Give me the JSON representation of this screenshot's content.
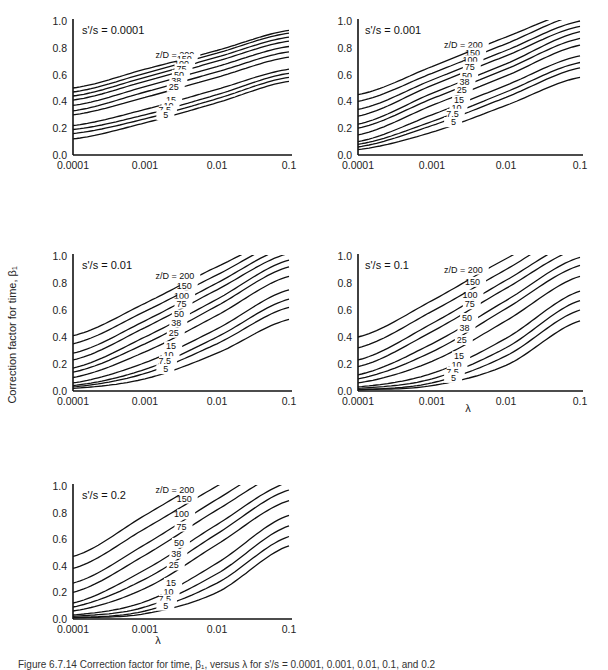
{
  "figure": {
    "y_axis_label": "Correction factor for time, β₁",
    "x_axis_label": "λ",
    "caption": "Figure 6.7.14 Correction factor for time, β₁, versus λ for s'/s = 0.0001, 0.001, 0.01, 0.1, and 0.2"
  },
  "chart_data": [
    {
      "type": "line",
      "title": "s'/s = 0.0001",
      "xlabel": "",
      "ylabel": "",
      "x_scale": "log",
      "xlim": [
        0.0001,
        0.1
      ],
      "ylim": [
        0,
        1.0
      ],
      "xticks": [
        "0.0001",
        "0.001",
        "0.01",
        "0.1"
      ],
      "yticks": [
        "0.0",
        "0.2",
        "0.4",
        "0.6",
        "0.8",
        "1.0"
      ],
      "label_prefix": "z/D = ",
      "x": [
        0.0001,
        0.001,
        0.01,
        0.1
      ],
      "series": [
        {
          "name": "200",
          "values": [
            0.5,
            0.64,
            0.78,
            0.93
          ]
        },
        {
          "name": "150",
          "values": [
            0.47,
            0.61,
            0.76,
            0.91
          ]
        },
        {
          "name": "100",
          "values": [
            0.44,
            0.58,
            0.73,
            0.88
          ]
        },
        {
          "name": "75",
          "values": [
            0.41,
            0.55,
            0.7,
            0.85
          ]
        },
        {
          "name": "50",
          "values": [
            0.37,
            0.51,
            0.66,
            0.81
          ]
        },
        {
          "name": "38",
          "values": [
            0.33,
            0.47,
            0.62,
            0.77
          ]
        },
        {
          "name": "25",
          "values": [
            0.3,
            0.43,
            0.58,
            0.73
          ]
        },
        {
          "name": "15",
          "values": [
            0.22,
            0.34,
            0.49,
            0.64
          ]
        },
        {
          "name": "10",
          "values": [
            0.19,
            0.3,
            0.45,
            0.61
          ]
        },
        {
          "name": "7.5",
          "values": [
            0.16,
            0.27,
            0.42,
            0.58
          ]
        },
        {
          "name": "5",
          "values": [
            0.12,
            0.24,
            0.39,
            0.55
          ]
        }
      ]
    },
    {
      "type": "line",
      "title": "s'/s = 0.001",
      "xlabel": "",
      "ylabel": "",
      "x_scale": "log",
      "xlim": [
        0.0001,
        0.1
      ],
      "ylim": [
        0,
        1.0
      ],
      "xticks": [
        "0.0001",
        "0.001",
        "0.01",
        "0.1"
      ],
      "yticks": [
        "0.0",
        "0.2",
        "0.4",
        "0.6",
        "0.8",
        "1.0"
      ],
      "label_prefix": "z/D = ",
      "x": [
        0.0001,
        0.001,
        0.01,
        0.1
      ],
      "series": [
        {
          "name": "200",
          "values": [
            0.45,
            0.66,
            0.88,
            1.08
          ]
        },
        {
          "name": "150",
          "values": [
            0.4,
            0.61,
            0.83,
            1.05
          ]
        },
        {
          "name": "100",
          "values": [
            0.34,
            0.56,
            0.78,
            1.0
          ]
        },
        {
          "name": "75",
          "values": [
            0.29,
            0.52,
            0.74,
            0.96
          ]
        },
        {
          "name": "50",
          "values": [
            0.23,
            0.46,
            0.68,
            0.92
          ]
        },
        {
          "name": "38",
          "values": [
            0.2,
            0.42,
            0.64,
            0.87
          ]
        },
        {
          "name": "25",
          "values": [
            0.15,
            0.37,
            0.59,
            0.82
          ]
        },
        {
          "name": "15",
          "values": [
            0.1,
            0.3,
            0.52,
            0.74
          ]
        },
        {
          "name": "10",
          "values": [
            0.08,
            0.25,
            0.47,
            0.69
          ]
        },
        {
          "name": "7.5",
          "values": [
            0.06,
            0.22,
            0.43,
            0.65
          ]
        },
        {
          "name": "5",
          "values": [
            0.04,
            0.17,
            0.37,
            0.58
          ]
        }
      ]
    },
    {
      "type": "line",
      "title": "s'/s = 0.01",
      "xlabel": "",
      "ylabel": "Correction factor for time, β₁",
      "x_scale": "log",
      "xlim": [
        0.0001,
        0.1
      ],
      "ylim": [
        0,
        1.0
      ],
      "xticks": [
        "0.0001",
        "0.001",
        "0.01",
        "0.1"
      ],
      "yticks": [
        "0.0",
        "0.2",
        "0.4",
        "0.6",
        "0.8",
        "1.0"
      ],
      "label_prefix": "z/D = ",
      "x": [
        0.0001,
        0.001,
        0.01,
        0.1
      ],
      "series": [
        {
          "name": "200",
          "values": [
            0.41,
            0.65,
            0.92,
            1.15
          ]
        },
        {
          "name": "150",
          "values": [
            0.35,
            0.59,
            0.86,
            1.12
          ]
        },
        {
          "name": "100",
          "values": [
            0.28,
            0.52,
            0.8,
            1.07
          ]
        },
        {
          "name": "75",
          "values": [
            0.23,
            0.47,
            0.75,
            1.02
          ]
        },
        {
          "name": "50",
          "values": [
            0.17,
            0.4,
            0.68,
            0.97
          ]
        },
        {
          "name": "38",
          "values": [
            0.14,
            0.35,
            0.63,
            0.92
          ]
        },
        {
          "name": "25",
          "values": [
            0.1,
            0.29,
            0.56,
            0.85
          ]
        },
        {
          "name": "15",
          "values": [
            0.06,
            0.21,
            0.46,
            0.75
          ]
        },
        {
          "name": "10",
          "values": [
            0.04,
            0.16,
            0.4,
            0.68
          ]
        },
        {
          "name": "7.5",
          "values": [
            0.03,
            0.13,
            0.35,
            0.62
          ]
        },
        {
          "name": "5",
          "values": [
            0.02,
            0.09,
            0.28,
            0.53
          ]
        }
      ]
    },
    {
      "type": "line",
      "title": "s'/s = 0.1",
      "xlabel": "λ",
      "ylabel": "",
      "x_scale": "log",
      "xlim": [
        0.0001,
        0.1
      ],
      "ylim": [
        0,
        1.0
      ],
      "xticks": [
        "0.0001",
        "0.001",
        "0.01",
        "0.1"
      ],
      "yticks": [
        "0.0",
        "0.2",
        "0.4",
        "0.6",
        "0.8",
        "1.0"
      ],
      "label_prefix": "z/D = ",
      "x": [
        0.0001,
        0.001,
        0.01,
        0.1
      ],
      "series": [
        {
          "name": "200",
          "values": [
            0.4,
            0.67,
            0.98,
            1.25
          ]
        },
        {
          "name": "150",
          "values": [
            0.32,
            0.59,
            0.9,
            1.2
          ]
        },
        {
          "name": "100",
          "values": [
            0.23,
            0.5,
            0.82,
            1.12
          ]
        },
        {
          "name": "75",
          "values": [
            0.18,
            0.44,
            0.76,
            1.06
          ]
        },
        {
          "name": "50",
          "values": [
            0.12,
            0.35,
            0.67,
            0.99
          ]
        },
        {
          "name": "38",
          "values": [
            0.09,
            0.29,
            0.61,
            0.93
          ]
        },
        {
          "name": "25",
          "values": [
            0.06,
            0.22,
            0.52,
            0.85
          ]
        },
        {
          "name": "15",
          "values": [
            0.03,
            0.13,
            0.39,
            0.74
          ]
        },
        {
          "name": "10",
          "values": [
            0.02,
            0.09,
            0.32,
            0.67
          ]
        },
        {
          "name": "7.5",
          "values": [
            0.01,
            0.06,
            0.26,
            0.6
          ]
        },
        {
          "name": "5",
          "values": [
            0.01,
            0.04,
            0.19,
            0.52
          ]
        }
      ]
    },
    {
      "type": "line",
      "title": "s'/s = 0.2",
      "xlabel": "λ",
      "ylabel": "",
      "x_scale": "log",
      "xlim": [
        0.0001,
        0.1
      ],
      "ylim": [
        0,
        1.0
      ],
      "xticks": [
        "0.0001",
        "0.001",
        "0.01",
        "0.1"
      ],
      "yticks": [
        "0.0",
        "0.2",
        "0.4",
        "0.6",
        "0.8",
        "1.0"
      ],
      "label_prefix": "z/D = ",
      "x": [
        0.0001,
        0.001,
        0.01,
        0.1
      ],
      "series": [
        {
          "name": "200",
          "values": [
            0.47,
            0.78,
            1.1,
            1.4
          ]
        },
        {
          "name": "150",
          "values": [
            0.38,
            0.68,
            1.0,
            1.3
          ]
        },
        {
          "name": "100",
          "values": [
            0.27,
            0.56,
            0.9,
            1.2
          ]
        },
        {
          "name": "75",
          "values": [
            0.2,
            0.48,
            0.82,
            1.12
          ]
        },
        {
          "name": "50",
          "values": [
            0.12,
            0.37,
            0.71,
            1.03
          ]
        },
        {
          "name": "38",
          "values": [
            0.09,
            0.3,
            0.64,
            0.97
          ]
        },
        {
          "name": "25",
          "values": [
            0.06,
            0.23,
            0.56,
            0.89
          ]
        },
        {
          "name": "15",
          "values": [
            0.03,
            0.13,
            0.42,
            0.78
          ]
        },
        {
          "name": "10",
          "values": [
            0.02,
            0.09,
            0.34,
            0.7
          ]
        },
        {
          "name": "7.5",
          "values": [
            0.01,
            0.06,
            0.27,
            0.62
          ]
        },
        {
          "name": "5",
          "values": [
            0.01,
            0.04,
            0.2,
            0.55
          ]
        }
      ]
    }
  ],
  "layout": {
    "panels": [
      {
        "x0": 73,
        "x1": 289,
        "y_top": 21,
        "y_bot": 155,
        "title_x": 82,
        "title_y": 30
      },
      {
        "x0": 358,
        "x1": 580,
        "y_top": 21,
        "y_bot": 155,
        "title_x": 365,
        "title_y": 30
      },
      {
        "x0": 73,
        "x1": 289,
        "y_top": 256,
        "y_bot": 391,
        "title_x": 82,
        "title_y": 265
      },
      {
        "x0": 358,
        "x1": 580,
        "y_top": 256,
        "y_bot": 391,
        "title_x": 365,
        "title_y": 265
      },
      {
        "x0": 73,
        "x1": 289,
        "y_top": 486,
        "y_bot": 619,
        "title_x": 82,
        "title_y": 495
      }
    ],
    "lambda_labels": [
      {
        "x": 468,
        "y": 412
      },
      {
        "x": 158,
        "y": 644
      }
    ]
  }
}
